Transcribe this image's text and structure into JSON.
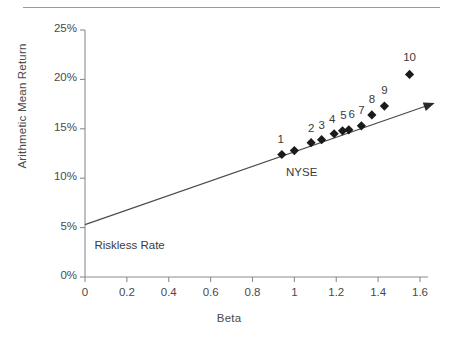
{
  "chart_data": {
    "type": "scatter",
    "title": "",
    "xlabel": "Beta",
    "ylabel": "Arithmetic Mean Return",
    "xlim": [
      0,
      1.6
    ],
    "ylim": [
      0,
      25
    ],
    "xticks": [
      "0",
      "0.2",
      "0.4",
      "0.6",
      "0.8",
      "1",
      "1.2",
      "1.4",
      "1.6"
    ],
    "xtick_values": [
      0,
      0.2,
      0.4,
      0.6,
      0.8,
      1,
      1.2,
      1.4,
      1.6
    ],
    "yticks": [
      "0%",
      "5%",
      "10%",
      "15%",
      "20%",
      "25%"
    ],
    "ytick_values": [
      0,
      5,
      10,
      15,
      20,
      25
    ],
    "grid": false,
    "legend": false,
    "marker": "diamond",
    "marker_color": "#1a1a1a",
    "line_color": "#4a4a4a",
    "axis_color": "#8c8c8c",
    "points": [
      {
        "label": "1",
        "beta": 0.94,
        "ret": 12.4,
        "label_dx": -1,
        "label_dy": -15
      },
      {
        "label": "",
        "beta": 1.0,
        "ret": 12.8,
        "label_dx": 0,
        "label_dy": 0
      },
      {
        "label": "2",
        "beta": 1.08,
        "ret": 13.6,
        "label_dx": 0,
        "label_dy": -15
      },
      {
        "label": "3",
        "beta": 1.13,
        "ret": 13.9,
        "label_dx": 0,
        "label_dy": -15
      },
      {
        "label": "4",
        "beta": 1.19,
        "ret": 14.5,
        "label_dx": -2,
        "label_dy": -15
      },
      {
        "label": "5",
        "beta": 1.23,
        "ret": 14.8,
        "label_dx": 1,
        "label_dy": -16
      },
      {
        "label": "6",
        "beta": 1.26,
        "ret": 14.9,
        "label_dx": 3,
        "label_dy": -16
      },
      {
        "label": "7",
        "beta": 1.32,
        "ret": 15.3,
        "label_dx": 0,
        "label_dy": -16
      },
      {
        "label": "8",
        "beta": 1.37,
        "ret": 16.4,
        "label_dx": 0,
        "label_dy": -16
      },
      {
        "label": "9",
        "beta": 1.43,
        "ret": 17.3,
        "label_dx": 0,
        "label_dy": -16
      },
      {
        "label": "10",
        "beta": 1.55,
        "ret": 20.5,
        "label_dx": 0,
        "label_dy": -17
      }
    ],
    "sml_line": {
      "intercept": 5.3,
      "end_beta": 1.67,
      "end_ret": 17.6,
      "arrow": true
    },
    "annotations": [
      {
        "name": "riskless-rate",
        "text": "Riskless Rate",
        "beta": 0.045,
        "ret": 3.0
      },
      {
        "name": "nyse",
        "text": "NYSE",
        "beta": 0.96,
        "ret": 10.4
      }
    ]
  }
}
